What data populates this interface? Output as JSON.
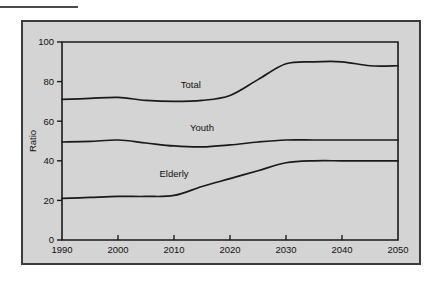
{
  "figure": {
    "background_color": "#ffffff",
    "panel_color": "#d4d4d4",
    "panel_border_color": "#3b3b3b",
    "line_color": "#1a1a1a",
    "rule_label": ""
  },
  "chart_data": {
    "type": "line",
    "title": "",
    "xlabel": "",
    "ylabel": "Ratio",
    "xlim": [
      1990,
      2050
    ],
    "ylim": [
      0,
      100
    ],
    "xticks": [
      1990,
      2000,
      2010,
      2020,
      2030,
      2040,
      2050
    ],
    "xtick_labels": [
      "1990",
      "2000",
      "2010",
      "2020",
      "2030",
      "2040",
      "2050"
    ],
    "yticks": [
      0,
      20,
      40,
      60,
      80,
      100
    ],
    "ytick_labels": [
      "0",
      "20",
      "40",
      "60",
      "80",
      "100"
    ],
    "grid": false,
    "legend": "inline-labels",
    "x": [
      1990,
      1995,
      2000,
      2005,
      2010,
      2015,
      2020,
      2025,
      2030,
      2035,
      2040,
      2045,
      2050
    ],
    "series": [
      {
        "name": "Total",
        "label_position": {
          "x": 2013,
          "y": 77
        },
        "values": [
          71,
          71.5,
          72,
          70.5,
          70,
          70.5,
          73,
          81,
          89,
          90,
          90,
          88,
          88
        ]
      },
      {
        "name": "Youth",
        "label_position": {
          "x": 2015,
          "y": 55
        },
        "values": [
          49.5,
          49.8,
          50.5,
          49,
          47.5,
          47,
          48,
          49.5,
          50.5,
          50.5,
          50.5,
          50.5,
          50.5
        ]
      },
      {
        "name": "Elderly",
        "label_position": {
          "x": 2010,
          "y": 32
        },
        "values": [
          21,
          21.5,
          22,
          22,
          22.5,
          27,
          31,
          35,
          39,
          40,
          40,
          40,
          40
        ]
      }
    ]
  }
}
